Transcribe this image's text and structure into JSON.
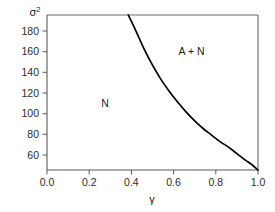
{
  "chart_data": {
    "type": "line",
    "title": "",
    "subtitle": "",
    "xlabel": "γ",
    "ylabel": "σ²",
    "ylabel_base": "σ",
    "ylabel_exponent": "2",
    "xlim": [
      0.0,
      1.0
    ],
    "ylim": [
      52,
      194
    ],
    "xticks": [
      0.0,
      0.2,
      0.4,
      0.6,
      0.8,
      1.0
    ],
    "xtick_labels": [
      "0.0",
      "0.2",
      "0.4",
      "0.6",
      "0.8",
      "1.0"
    ],
    "yticks": [
      60,
      80,
      100,
      120,
      140,
      160,
      180
    ],
    "ytick_labels": [
      "60",
      "80",
      "100",
      "120",
      "140",
      "160",
      "180"
    ],
    "grid": false,
    "legend": "none",
    "frame": "box",
    "series": [
      {
        "name": "phase-boundary",
        "color": "#000000",
        "x": [
          0.385,
          0.42,
          0.46,
          0.5,
          0.54,
          0.58,
          0.62,
          0.66,
          0.7,
          0.74,
          0.78,
          0.82,
          0.86,
          0.9,
          0.94,
          0.97,
          1.0
        ],
        "y": [
          194,
          180,
          163,
          148,
          135,
          124,
          114,
          105,
          97,
          90,
          84,
          78,
          73,
          67,
          61,
          57,
          52
        ]
      }
    ],
    "annotations": [
      {
        "text": "N",
        "x": 0.275,
        "y": 110,
        "name": "region-label-n"
      },
      {
        "text": "A + N",
        "x": 0.685,
        "y": 157,
        "name": "region-label-a-plus-n"
      }
    ]
  },
  "axes": {
    "y_axis_title_display": "σ²",
    "x_axis_title_display": "γ"
  }
}
